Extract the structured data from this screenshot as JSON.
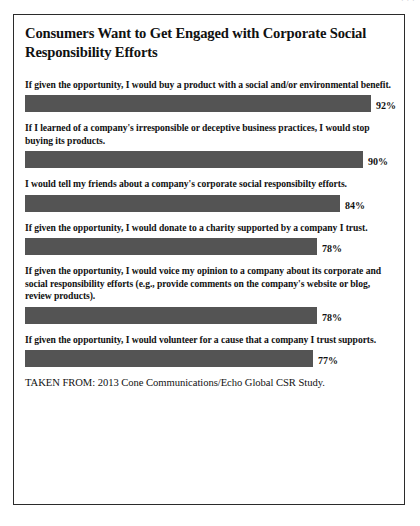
{
  "running_head": "· · ·",
  "chart_data": {
    "type": "bar",
    "orientation": "horizontal",
    "title": "Consumers Want to Get Engaged with Corporate Social Responsibility Efforts",
    "xlabel": "",
    "ylabel": "",
    "xlim": [
      0,
      100
    ],
    "grid": false,
    "legend": "none",
    "bar_color": "#545454",
    "value_suffix": "%",
    "categories": [
      "If given the opportunity, I would buy a product with a social and/or environmental benefit.",
      "If I learned of a company's irresponsible or deceptive business practices, I would stop buying its products.",
      "I would tell my friends about a company's corporate social responsibilty efforts.",
      "If given the opportunity, I would donate to a charity supported by a company I trust.",
      "If given the opportunity, I would voice my opinion to a company about its corporate and social responsibility efforts (e.g., provide comments on the company's website or blog, review products).",
      "If given the opportunity, I would volunteer for a cause that a company I trust supports."
    ],
    "values": [
      92,
      90,
      84,
      78,
      78,
      77
    ],
    "value_labels": [
      "92%",
      "90%",
      "84%",
      "78%",
      "78%",
      "77%"
    ],
    "source": "TAKEN FROM: 2013 Cone Communications/Echo Global CSR Study."
  },
  "items": [
    {
      "label": "If given the opportunity, I would buy a product with a social and/or environmental benefit.",
      "value": 92,
      "value_label": "92%",
      "bar_width_px": 346
    },
    {
      "label": "If I learned of a company's irresponsible or deceptive business practices, I would stop buying its products.",
      "value": 90,
      "value_label": "90%",
      "bar_width_px": 338
    },
    {
      "label": "I would tell my friends about a company's corporate social responsibilty efforts.",
      "value": 84,
      "value_label": "84%",
      "bar_width_px": 315
    },
    {
      "label": "If given the opportunity, I would donate to a charity supported by a company I trust.",
      "value": 78,
      "value_label": "78%",
      "bar_width_px": 292
    },
    {
      "label": "If given the opportunity, I would voice my opinion to a company about its corporate and social responsibility efforts (e.g., provide comments on the company's website or blog, review products).",
      "value": 78,
      "value_label": "78%",
      "bar_width_px": 292
    },
    {
      "label": "If given the opportunity, I would volunteer for a cause that a company I trust supports.",
      "value": 77,
      "value_label": "77%",
      "bar_width_px": 288
    }
  ]
}
